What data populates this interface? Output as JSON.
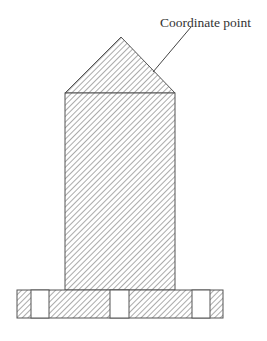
{
  "diagram": {
    "annotation": {
      "label": "Coordinate point",
      "text_x": 160,
      "text_y": 27,
      "leader_from": [
        191,
        27
      ],
      "leader_to": [
        153,
        72
      ]
    },
    "colors": {
      "stroke": "#555555",
      "hatch": "#666666",
      "background": "#ffffff",
      "text": "#333333"
    },
    "shapes": {
      "roof_triangle": {
        "points": "65,93 121,37 175,93"
      },
      "column_rect": {
        "x": 65,
        "y": 93,
        "w": 110,
        "h": 197
      },
      "base_rect": {
        "x": 17,
        "y": 290,
        "w": 206,
        "h": 28
      },
      "base_openings": [
        {
          "x": 31,
          "w": 18
        },
        {
          "x": 110,
          "w": 19
        },
        {
          "x": 192,
          "w": 18
        }
      ]
    }
  }
}
